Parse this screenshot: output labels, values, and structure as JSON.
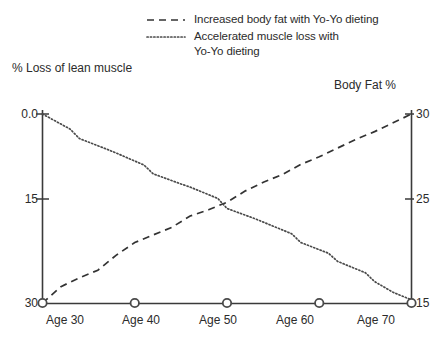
{
  "chart_data": {
    "type": "line",
    "title": "",
    "subtitle": "",
    "xlabel": "",
    "ylabel": "% Loss of lean muscle",
    "y2label": "Body Fat %",
    "grid": false,
    "legend_position": "top",
    "x": [
      30,
      40,
      50,
      60,
      70
    ],
    "categories": [
      "Age 30",
      "Age 40",
      "Age 50",
      "Age 60",
      "Age 70"
    ],
    "xlim": [
      30,
      70
    ],
    "ylim": [
      30,
      0
    ],
    "y2lim": [
      15,
      30
    ],
    "yticks": [
      "0.0",
      "15",
      "30"
    ],
    "ytick_values": [
      0,
      15,
      30
    ],
    "y2ticks": [
      "30",
      "25",
      "15"
    ],
    "y2tick_values": [
      30,
      25,
      15
    ],
    "series": [
      {
        "name": "Increased body fat with Yo-Yo dieting",
        "axis": "right",
        "style": "dashed",
        "values": [
          15.0,
          19.8,
          23.0,
          26.6,
          30.0
        ],
        "points": [
          [
            30,
            15.0
          ],
          [
            32,
            16.3
          ],
          [
            34,
            17.0
          ],
          [
            36,
            17.6
          ],
          [
            38,
            18.8
          ],
          [
            40,
            19.8
          ],
          [
            42,
            20.4
          ],
          [
            44,
            21.0
          ],
          [
            46,
            21.9
          ],
          [
            48,
            22.4
          ],
          [
            50,
            23.0
          ],
          [
            52,
            23.9
          ],
          [
            54,
            24.6
          ],
          [
            56,
            25.2
          ],
          [
            58,
            26.0
          ],
          [
            60,
            26.6
          ],
          [
            62,
            27.3
          ],
          [
            64,
            28.0
          ],
          [
            66,
            28.6
          ],
          [
            68,
            29.3
          ],
          [
            70,
            30.0
          ]
        ]
      },
      {
        "name": "Accelerated muscle loss with Yo-Yo dieting",
        "axis": "left",
        "style": "dotted",
        "values": [
          0.0,
          6.8,
          14.0,
          21.5,
          29.5
        ],
        "points": [
          [
            30,
            0.0
          ],
          [
            33,
            2.4
          ],
          [
            34,
            3.9
          ],
          [
            37,
            5.6
          ],
          [
            38,
            6.2
          ],
          [
            41,
            8.1
          ],
          [
            42,
            9.5
          ],
          [
            45,
            11.1
          ],
          [
            46,
            11.6
          ],
          [
            49,
            13.4
          ],
          [
            50,
            15.0
          ],
          [
            53,
            16.6
          ],
          [
            54,
            17.2
          ],
          [
            57,
            19.0
          ],
          [
            58,
            20.4
          ],
          [
            61,
            22.1
          ],
          [
            62,
            23.4
          ],
          [
            65,
            25.2
          ],
          [
            66,
            26.6
          ],
          [
            68,
            28.3
          ],
          [
            70,
            29.5
          ]
        ]
      }
    ],
    "legend": [
      {
        "label": "Increased body fat with Yo-Yo dieting",
        "style": "dashed"
      },
      {
        "label": "Accelerated muscle loss with\nYo-Yo dieting",
        "style": "dotted"
      }
    ],
    "markers": {
      "shape": "open-circle",
      "on_axis": "x",
      "at": [
        "Age 30",
        "Age 40",
        "Age 50",
        "Age 60",
        "Age 70"
      ]
    },
    "colors": {
      "axis": "#3a3a3a",
      "body_fat_line": "#333333",
      "muscle_loss_line": "#4a4a4a",
      "background": "#ffffff",
      "text": "#2b2b2b"
    }
  }
}
